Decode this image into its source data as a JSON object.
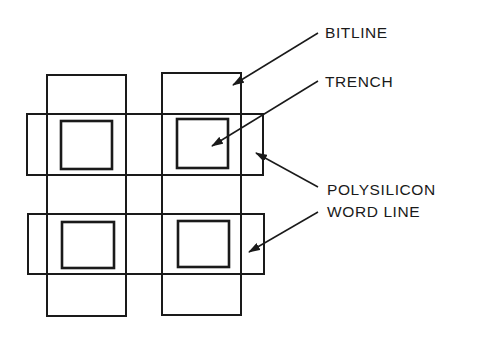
{
  "diagram": {
    "type": "trench DRAM cell layout",
    "labels": {
      "bitline": "BITLINE",
      "trench": "TRENCH",
      "wordline_1": "POLYSILICON",
      "wordline_2": "WORD LINE"
    },
    "colors": {
      "stroke": "#1a1a1a",
      "background": "#ffffff"
    },
    "bitlines": [
      {
        "x": 47,
        "y": 75,
        "w": 79,
        "h": 241
      },
      {
        "x": 162,
        "y": 73,
        "w": 79,
        "h": 242
      }
    ],
    "wordlines": [
      {
        "x": 27,
        "y": 114,
        "w": 236,
        "h": 61
      },
      {
        "x": 28,
        "y": 214,
        "w": 236,
        "h": 60
      }
    ],
    "trenches": [
      {
        "x": 61,
        "y": 121,
        "w": 51,
        "h": 48
      },
      {
        "x": 177,
        "y": 119,
        "w": 51,
        "h": 49
      },
      {
        "x": 62,
        "y": 222,
        "w": 52,
        "h": 46
      },
      {
        "x": 178,
        "y": 221,
        "w": 51,
        "h": 46
      }
    ]
  }
}
